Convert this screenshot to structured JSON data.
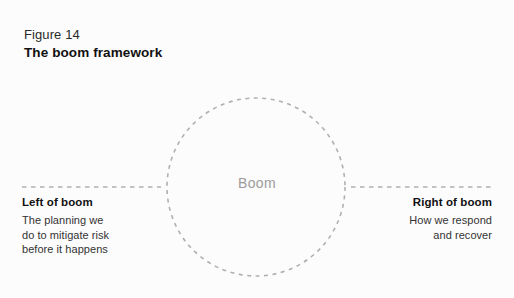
{
  "figure": {
    "number": "Figure 14",
    "title": "The boom framework"
  },
  "center": {
    "label": "Boom"
  },
  "left": {
    "heading": "Left of boom",
    "body_lines": [
      "The planning we",
      "do to mitigate risk",
      "before it happens"
    ]
  },
  "right": {
    "heading": "Right of boom",
    "body_lines": [
      "How we respond",
      "and recover"
    ]
  },
  "style": {
    "background": "#fcfcfc",
    "stroke": "#b0b0b0",
    "heading_color": "#111111",
    "body_color": "#333333",
    "center_label_color": "#9b9b9b"
  },
  "geometry": {
    "circle_center_x": 256,
    "circle_center_y": 187,
    "circle_radius": 89,
    "axis_y": 187,
    "axis_left_start": 22,
    "axis_left_end": 161,
    "axis_right_start": 351,
    "axis_right_end": 492
  }
}
